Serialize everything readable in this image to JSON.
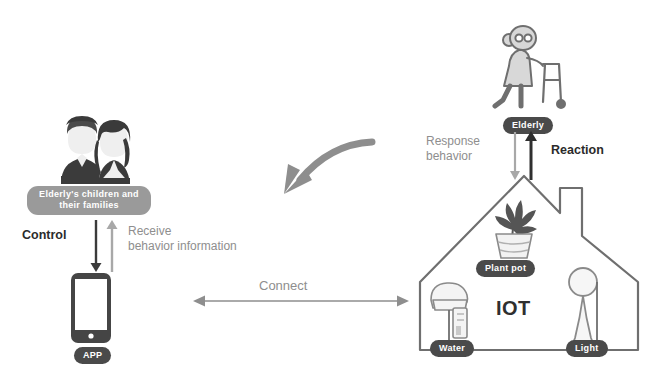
{
  "diagram": {
    "colors": {
      "pill_dark": "#4a4a4a",
      "pill_soft": "#9a9a9a",
      "text_dark": "#2b2b2b",
      "text_gray": "#8e8e8e",
      "outline": "#6f6f6f",
      "background": "#ffffff"
    }
  },
  "actors": {
    "family": {
      "label": "Elderly's children\nand their families",
      "icon": "family-couple-icon"
    },
    "elderly": {
      "label": "Elderly",
      "icon": "elderly-walker-icon"
    },
    "app": {
      "label": "APP",
      "icon": "smartphone-icon"
    },
    "house": {
      "label": "IOT",
      "icon": "house-outline-icon"
    }
  },
  "devices": [
    {
      "label": "Plant pot",
      "icon": "potted-plant-icon"
    },
    {
      "label": "Water",
      "icon": "water-dispenser-icon"
    },
    {
      "label": "Light",
      "icon": "floor-lamp-icon"
    }
  ],
  "flows": {
    "control": {
      "label": "Control",
      "direction": "down",
      "emphasis": "bold"
    },
    "receive": {
      "label": "Receive\nbehavior information",
      "direction": "up",
      "emphasis": "normal"
    },
    "connect": {
      "label": "Connect",
      "direction": "bidirectional",
      "emphasis": "normal"
    },
    "response": {
      "label": "Response\nbehavior",
      "direction": "down",
      "emphasis": "normal"
    },
    "reaction": {
      "label": "Reaction",
      "direction": "up",
      "emphasis": "bold"
    },
    "curved": {
      "label": "",
      "direction": "house-to-family",
      "icon": "curved-arrow-icon"
    }
  }
}
